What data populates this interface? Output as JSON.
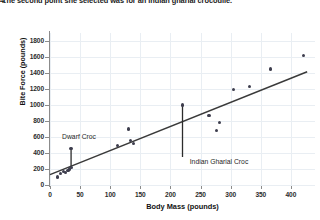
{
  "question": {
    "bullet": "4.",
    "text": "The second point she selected was for an Indian gharial crocodile."
  },
  "chart_data": {
    "type": "scatter",
    "title": "",
    "xlabel": "Body Mass (pounds)",
    "ylabel": "Bite Force (pounds)",
    "xlim": [
      0,
      440
    ],
    "ylim": [
      0,
      1900
    ],
    "xticks": [
      0,
      50,
      100,
      150,
      200,
      250,
      300,
      350,
      400
    ],
    "yticks": [
      0,
      200,
      400,
      600,
      800,
      1000,
      1200,
      1400,
      1600,
      1800
    ],
    "grid": true,
    "legend_position": "none",
    "marker_color": "#3d3d4d",
    "trendline_color": "#3a3a3a",
    "points": [
      {
        "x": 12,
        "y": 100
      },
      {
        "x": 18,
        "y": 140
      },
      {
        "x": 22,
        "y": 170
      },
      {
        "x": 26,
        "y": 155
      },
      {
        "x": 30,
        "y": 185
      },
      {
        "x": 33,
        "y": 200
      },
      {
        "x": 36,
        "y": 215
      },
      {
        "x": 35,
        "y": 460,
        "label": "Dwarf Croc"
      },
      {
        "x": 112,
        "y": 490
      },
      {
        "x": 130,
        "y": 700
      },
      {
        "x": 134,
        "y": 560
      },
      {
        "x": 138,
        "y": 515
      },
      {
        "x": 220,
        "y": 1000,
        "label": "Indian Gharial Croc"
      },
      {
        "x": 264,
        "y": 870
      },
      {
        "x": 276,
        "y": 680
      },
      {
        "x": 281,
        "y": 780
      },
      {
        "x": 305,
        "y": 1190
      },
      {
        "x": 331,
        "y": 1235
      },
      {
        "x": 366,
        "y": 1450
      },
      {
        "x": 421,
        "y": 1620
      }
    ],
    "trendline": {
      "x0": 0,
      "y0": 130,
      "x1": 427,
      "y1": 1415
    },
    "annotations": [
      {
        "label": "Dwarf Croc",
        "point_x": 35,
        "point_y": 460,
        "leader_from_y": 460,
        "leader_to_y": 235,
        "label_x": 20,
        "label_y": 600,
        "label_anchor": "left"
      },
      {
        "label": "Indian Gharial Croc",
        "point_x": 220,
        "point_y": 1000,
        "leader_from_y": 1000,
        "leader_to_y": 350,
        "label_x": 232,
        "label_y": 285,
        "label_anchor": "left"
      }
    ]
  }
}
